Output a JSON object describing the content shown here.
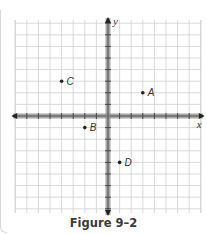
{
  "chart_data": {
    "type": "scatter",
    "title": "Figure 9–2",
    "xlabel": "x",
    "ylabel": "y",
    "xlim": [
      -8,
      8
    ],
    "ylim": [
      -8,
      8
    ],
    "grid": true,
    "points": [
      {
        "label": "A",
        "x": 3,
        "y": 2
      },
      {
        "label": "B",
        "x": -2,
        "y": -1
      },
      {
        "label": "C",
        "x": -4,
        "y": 3
      },
      {
        "label": "D",
        "x": 1,
        "y": -4
      }
    ]
  },
  "figure": {
    "caption": "Figure 9–2"
  },
  "colors": {
    "grid": "#cfcfcf",
    "axis": "#8a8a8a",
    "axis_tick": "#3c3c3c",
    "point": "#222222",
    "caption": "#3a3a3a"
  }
}
